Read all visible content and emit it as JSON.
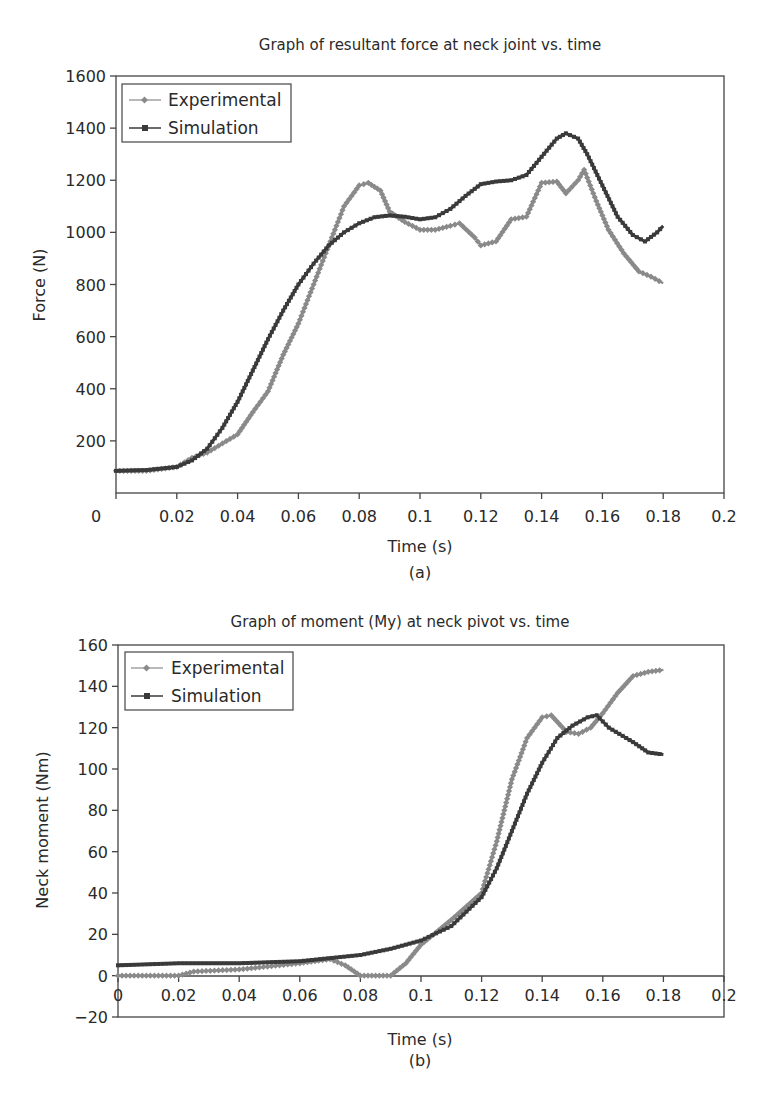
{
  "chart_data": [
    {
      "type": "line",
      "title": "Graph of resultant force at neck joint vs. time",
      "subtitle": "(a)",
      "xlabel": "Time (s)",
      "ylabel": "Force (N)",
      "xlim": [
        0,
        0.2
      ],
      "ylim": [
        0,
        1600
      ],
      "xticks": [
        "0",
        "0.02",
        "0.04",
        "0.06",
        "0.08",
        "0.1",
        "0.12",
        "0.14",
        "0.16",
        "0.18",
        "0.2"
      ],
      "yticks": [
        "200",
        "400",
        "600",
        "800",
        "1000",
        "1200",
        "1400",
        "1600"
      ],
      "grid": false,
      "legend_position": "upper left",
      "series": [
        {
          "name": "Experimental",
          "color": "#8a8a8a",
          "marker": "diamond",
          "x": [
            0,
            0.01,
            0.02,
            0.025,
            0.03,
            0.035,
            0.04,
            0.045,
            0.05,
            0.055,
            0.06,
            0.065,
            0.07,
            0.075,
            0.08,
            0.083,
            0.087,
            0.09,
            0.095,
            0.1,
            0.105,
            0.11,
            0.113,
            0.118,
            0.12,
            0.125,
            0.13,
            0.135,
            0.14,
            0.145,
            0.148,
            0.152,
            0.154,
            0.158,
            0.162,
            0.167,
            0.172,
            0.176,
            0.18
          ],
          "values": [
            85,
            85,
            100,
            135,
            155,
            190,
            225,
            310,
            390,
            530,
            650,
            800,
            950,
            1100,
            1180,
            1190,
            1160,
            1080,
            1040,
            1010,
            1010,
            1025,
            1035,
            980,
            950,
            965,
            1050,
            1060,
            1190,
            1195,
            1150,
            1200,
            1240,
            1120,
            1010,
            920,
            850,
            830,
            805
          ]
        },
        {
          "name": "Simulation",
          "color": "#3a3a3a",
          "marker": "square",
          "x": [
            0,
            0.01,
            0.02,
            0.025,
            0.03,
            0.035,
            0.04,
            0.045,
            0.05,
            0.055,
            0.06,
            0.065,
            0.07,
            0.075,
            0.08,
            0.085,
            0.09,
            0.095,
            0.1,
            0.105,
            0.11,
            0.115,
            0.12,
            0.125,
            0.13,
            0.135,
            0.14,
            0.145,
            0.148,
            0.152,
            0.155,
            0.16,
            0.165,
            0.17,
            0.174,
            0.178,
            0.18
          ],
          "values": [
            85,
            88,
            100,
            125,
            170,
            250,
            350,
            470,
            590,
            700,
            800,
            880,
            950,
            1000,
            1035,
            1058,
            1065,
            1060,
            1050,
            1058,
            1090,
            1140,
            1185,
            1195,
            1200,
            1220,
            1290,
            1360,
            1380,
            1360,
            1300,
            1180,
            1060,
            990,
            965,
            1000,
            1025
          ]
        }
      ]
    },
    {
      "type": "line",
      "title": "Graph of moment (My) at neck pivot vs. time",
      "subtitle": "(b)",
      "xlabel": "Time (s)",
      "ylabel": "Neck moment (Nm)",
      "xlim": [
        0,
        0.2
      ],
      "ylim": [
        -20,
        160
      ],
      "xticks": [
        "0",
        "0.02",
        "0.04",
        "0.06",
        "0.08",
        "0.1",
        "0.12",
        "0.14",
        "0.16",
        "0.18",
        "0.2"
      ],
      "yticks": [
        "−20",
        "0",
        "20",
        "40",
        "60",
        "80",
        "100",
        "120",
        "140",
        "160"
      ],
      "grid": false,
      "legend_position": "upper left",
      "series": [
        {
          "name": "Experimental",
          "color": "#8a8a8a",
          "marker": "diamond",
          "x": [
            0,
            0.02,
            0.025,
            0.04,
            0.06,
            0.07,
            0.075,
            0.08,
            0.09,
            0.095,
            0.1,
            0.11,
            0.12,
            0.125,
            0.13,
            0.135,
            0.14,
            0.143,
            0.148,
            0.152,
            0.156,
            0.16,
            0.165,
            0.17,
            0.175,
            0.18
          ],
          "values": [
            0,
            0,
            2,
            3,
            6,
            8,
            5,
            0,
            0,
            6,
            15,
            27,
            40,
            65,
            95,
            115,
            125,
            126,
            118,
            117,
            120,
            127,
            137,
            145,
            147,
            148
          ]
        },
        {
          "name": "Simulation",
          "color": "#3a3a3a",
          "marker": "square",
          "x": [
            0,
            0.02,
            0.04,
            0.06,
            0.08,
            0.09,
            0.1,
            0.11,
            0.12,
            0.125,
            0.13,
            0.135,
            0.14,
            0.145,
            0.15,
            0.155,
            0.158,
            0.162,
            0.17,
            0.175,
            0.18
          ],
          "values": [
            5,
            6,
            6,
            7,
            10,
            13,
            17,
            24,
            38,
            52,
            70,
            88,
            103,
            115,
            121,
            125,
            126,
            120,
            113,
            108,
            107
          ]
        }
      ]
    }
  ]
}
